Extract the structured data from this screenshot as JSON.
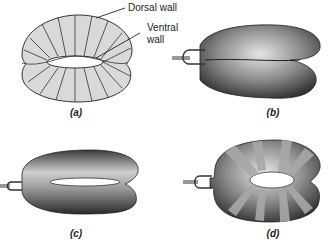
{
  "figure": {
    "panels": [
      {
        "id": "a",
        "label": "(a)"
      },
      {
        "id": "b",
        "label": "(b)"
      },
      {
        "id": "c",
        "label": "(c)"
      },
      {
        "id": "d",
        "label": "(d)"
      }
    ],
    "callouts": {
      "dorsal_wall": "Dorsal wall",
      "ventral_wall_line1": "Ventral",
      "ventral_wall_line2": "wall"
    },
    "colors": {
      "fill_light": "#d9d9d9",
      "stroke": "#333333",
      "shade_dark": "#4a4a4a",
      "band": "#a8a8a8"
    }
  }
}
